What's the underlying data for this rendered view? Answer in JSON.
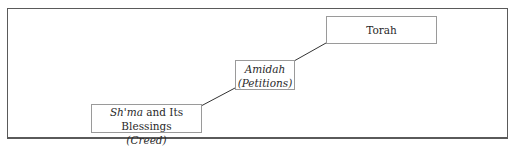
{
  "diagram": {
    "type": "ascending-steps",
    "nodes": [
      {
        "id": "shma",
        "line1_italic": "Sh'ma",
        "line1_rest": " and Its Blessings",
        "line2": "(Creed)"
      },
      {
        "id": "amidah",
        "line1": "Amidah",
        "line2": "(Petitions)"
      },
      {
        "id": "torah",
        "line1": "Torah"
      }
    ],
    "edges": [
      {
        "from": "shma",
        "to": "amidah"
      },
      {
        "from": "amidah",
        "to": "torah"
      }
    ],
    "colors": {
      "frame": "#5a5a5a",
      "box_border": "#9a9a9a",
      "line": "#333333",
      "text": "#2a2a2a"
    }
  }
}
